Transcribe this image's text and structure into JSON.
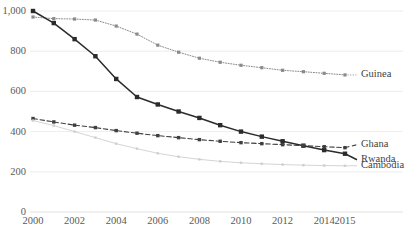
{
  "chart_data": {
    "type": "line",
    "title": "",
    "subtitle": "",
    "xlabel": "",
    "ylabel": "",
    "xlim": [
      2000,
      2015
    ],
    "ylim": [
      0,
      1000
    ],
    "grid": true,
    "legend_position": "right-inline-end-of-line",
    "x": [
      2000,
      2001,
      2002,
      2003,
      2004,
      2005,
      2006,
      2007,
      2008,
      2009,
      2010,
      2011,
      2012,
      2013,
      2014,
      2015
    ],
    "xticks": [
      "2000",
      "2002",
      "2004",
      "2006",
      "2008",
      "2010",
      "2012",
      "2014",
      "2015"
    ],
    "xtick_values": [
      2000,
      2002,
      2004,
      2006,
      2008,
      2010,
      2012,
      2014,
      2015
    ],
    "yticks": [
      "0",
      "200",
      "400",
      "600",
      "800",
      "1,000"
    ],
    "ytick_values": [
      0,
      200,
      400,
      600,
      800,
      1000
    ],
    "series": [
      {
        "name": "Guinea",
        "style": "dotted",
        "color": "#8a8a8a",
        "marker": "square",
        "label": "Guinea",
        "values": [
          970,
          962,
          960,
          955,
          925,
          885,
          830,
          795,
          765,
          745,
          730,
          718,
          705,
          698,
          690,
          682
        ]
      },
      {
        "name": "Rwanda",
        "style": "solid",
        "color": "#2b2b2b",
        "marker": "square",
        "label": "Rwanda",
        "values": [
          1000,
          940,
          860,
          775,
          662,
          572,
          535,
          500,
          468,
          432,
          400,
          375,
          352,
          330,
          308,
          290
        ]
      },
      {
        "name": "Ghana",
        "style": "dashed",
        "color": "#3f3f3f",
        "marker": "square",
        "label": "Ghana",
        "values": [
          465,
          448,
          432,
          420,
          405,
          392,
          380,
          370,
          360,
          352,
          345,
          340,
          335,
          330,
          325,
          320
        ]
      },
      {
        "name": "Cambodia",
        "style": "solid-light",
        "color": "#cfcfcf",
        "marker": "square",
        "label": "Cambodia",
        "values": [
          455,
          430,
          400,
          370,
          340,
          315,
          292,
          275,
          262,
          252,
          245,
          240,
          236,
          233,
          231,
          230
        ]
      }
    ]
  },
  "axis": {
    "y_label_0": "0",
    "y_label_200": "200",
    "y_label_400": "400",
    "y_label_600": "600",
    "y_label_800": "800",
    "y_label_1000": "1,000"
  },
  "labels": {
    "guinea": "Guinea",
    "ghana": "Ghana",
    "rwanda": "Rwanda",
    "cambodia": "Cambodia"
  }
}
